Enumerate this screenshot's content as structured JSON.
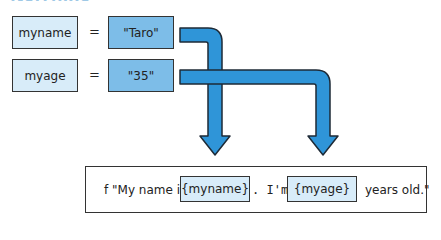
{
  "title": "f-strings",
  "assignments": [
    {
      "name": "myname",
      "op": "=",
      "value": "\"Taro\""
    },
    {
      "name": "myage",
      "op": "=",
      "value": "\"35\""
    }
  ],
  "fstring": {
    "prefix": "f \"My name is",
    "placeholder1": "{myname}",
    "middle": ". I'm",
    "placeholder2": "{myage}",
    "suffix": "years old.\""
  },
  "colors": {
    "arrow": "#2f95d8",
    "var_box": "#d8ecf9",
    "value_box": "#7dbde8"
  }
}
